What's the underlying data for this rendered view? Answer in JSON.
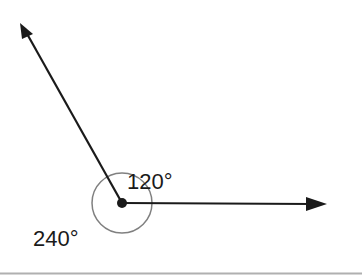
{
  "diagram": {
    "type": "angle",
    "vertex": {
      "x": 122,
      "y": 203
    },
    "rays": [
      {
        "name": "ray-up-left",
        "to": {
          "x": 20,
          "y": 23
        }
      },
      {
        "name": "ray-right",
        "to": {
          "x": 327,
          "y": 204
        }
      }
    ],
    "arc": {
      "radius": 30,
      "color": "#808080"
    },
    "labels": {
      "inner_angle": "120°",
      "outer_angle": "240°"
    },
    "colors": {
      "line": "#1a1a1a",
      "arc": "#808080",
      "baseline": "#b0b0b0"
    }
  }
}
